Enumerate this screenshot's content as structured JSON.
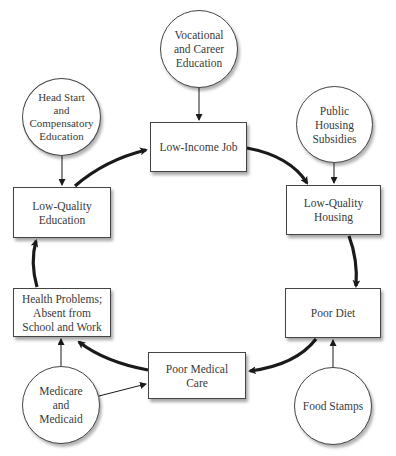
{
  "diagram": {
    "cycle_nodes": [
      {
        "id": "low-income-job",
        "label": "Low-Income Job"
      },
      {
        "id": "low-quality-housing",
        "label": "Low-Quality\nHousing"
      },
      {
        "id": "poor-diet",
        "label": "Poor Diet"
      },
      {
        "id": "poor-medical-care",
        "label": "Poor Medical\nCare"
      },
      {
        "id": "health-problems",
        "label": "Health Problems;\nAbsent from\nSchool and Work"
      },
      {
        "id": "low-quality-education",
        "label": "Low-Quality\nEducation"
      }
    ],
    "intervention_nodes": [
      {
        "id": "vocational",
        "label": "Vocational\nand Career\nEducation",
        "targets": "low-income-job"
      },
      {
        "id": "public-housing",
        "label": "Public\nHousing\nSubsidies",
        "targets": "low-quality-housing"
      },
      {
        "id": "food-stamps",
        "label": "Food Stamps",
        "targets": "poor-diet"
      },
      {
        "id": "medicare",
        "label": "Medicare\nand\nMedicaid",
        "targets": "health-problems, poor-medical-care"
      },
      {
        "id": "head-start",
        "label": "Head Start\nand\nCompensatory\nEducation",
        "targets": "low-quality-education"
      }
    ],
    "cycle_order": [
      "Low-Income Job",
      "Low-Quality Housing",
      "Poor Diet",
      "Poor Medical Care",
      "Health Problems; Absent from School and Work",
      "Low-Quality Education"
    ],
    "colors": {
      "line": "#1a1a1a",
      "border": "#444444",
      "background": "#ffffff"
    }
  }
}
